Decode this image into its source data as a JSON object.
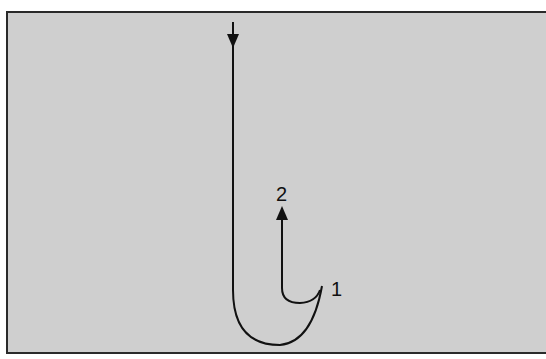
{
  "diagram": {
    "type": "path-trajectory",
    "background_color": "#cfcfcf",
    "stroke_color": "#111111",
    "labels": [
      {
        "id": "1",
        "text": "1"
      },
      {
        "id": "2",
        "text": "2"
      }
    ],
    "paths": [
      {
        "name": "main-hook-path",
        "direction": "downward entry, curves up to point 1"
      },
      {
        "name": "return-path",
        "direction": "from point 1 curving back and up to point 2"
      }
    ]
  }
}
